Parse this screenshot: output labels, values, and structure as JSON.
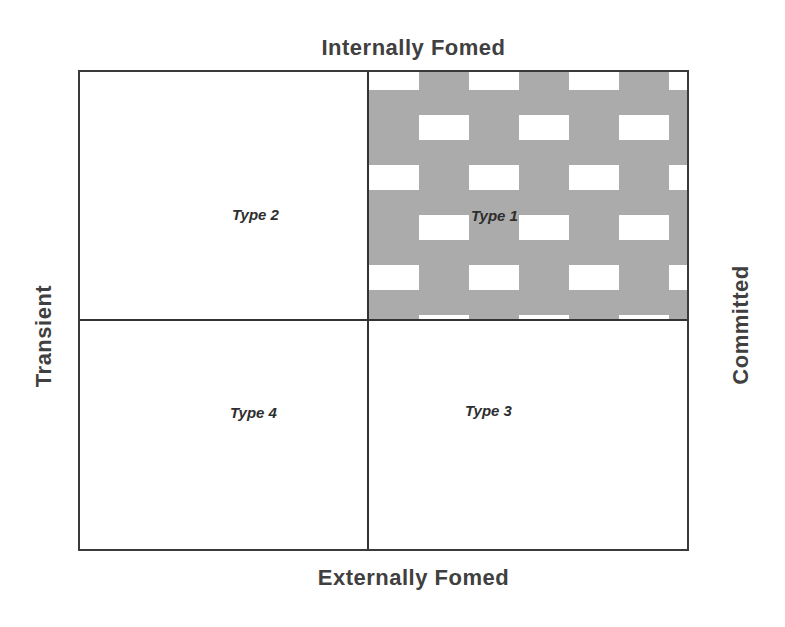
{
  "diagram": {
    "type": "2x2 matrix",
    "axes": {
      "top": "Internally Fomed",
      "bottom": "Externally Fomed",
      "left": "Transient",
      "right": "Committed"
    },
    "quadrants": [
      {
        "id": "q1",
        "position": "top-right",
        "label": "Type 1",
        "fill": "patterned-gray"
      },
      {
        "id": "q2",
        "position": "top-left",
        "label": "Type 2",
        "fill": "white"
      },
      {
        "id": "q3",
        "position": "bottom-right",
        "label": "Type 3",
        "fill": "white"
      },
      {
        "id": "q4",
        "position": "bottom-left",
        "label": "Type 4",
        "fill": "white"
      }
    ],
    "colors": {
      "line": "#333333",
      "pattern_gray": "#ababab",
      "pattern_brick": "#ffffff",
      "text": "#404040"
    }
  }
}
